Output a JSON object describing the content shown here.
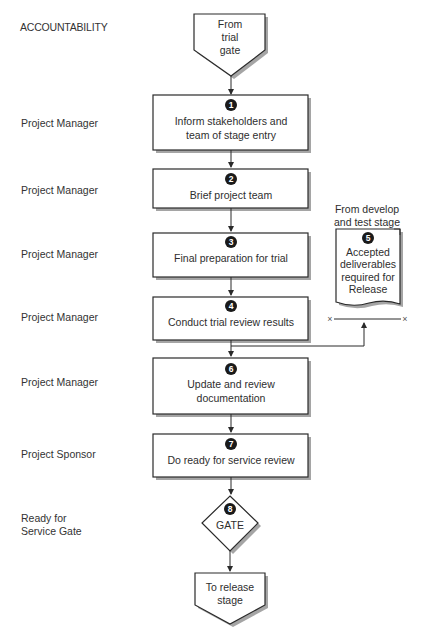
{
  "heading": "ACCOUNTABILITY",
  "colors": {
    "stroke": "#2a2a2a",
    "shadow": "#9a9a9a",
    "fill": "#ffffff",
    "badge": "#1a1a1a"
  },
  "accountability": [
    {
      "label": "Project Manager",
      "step": "1"
    },
    {
      "label": "Project Manager",
      "step": "2"
    },
    {
      "label": "Project Manager",
      "step": "3"
    },
    {
      "label": "Project Manager",
      "step": "4"
    },
    {
      "label": "Project Manager",
      "step": "6"
    },
    {
      "label": "Project Sponsor",
      "step": "7"
    },
    {
      "label_line1": "Ready for",
      "label_line2": "Service Gate",
      "step": "8"
    }
  ],
  "start": {
    "lines": [
      "From",
      "trial",
      "gate"
    ]
  },
  "steps": [
    {
      "number": "1",
      "lines": [
        "Inform stakeholders and",
        "team of stage entry"
      ]
    },
    {
      "number": "2",
      "lines": [
        "Brief project team"
      ]
    },
    {
      "number": "3",
      "lines": [
        "Final preparation for trial"
      ]
    },
    {
      "number": "4",
      "lines": [
        "Conduct trial review results"
      ]
    },
    {
      "number": "6",
      "lines": [
        "Update and review",
        "documentation"
      ]
    },
    {
      "number": "7",
      "lines": [
        "Do ready for service review"
      ]
    }
  ],
  "input_doc": {
    "caption_lines": [
      "From develop",
      "and test stage"
    ],
    "number": "5",
    "lines": [
      "Accepted",
      "deliverables",
      "required for",
      "Release"
    ]
  },
  "gate": {
    "number": "8",
    "label": "GATE"
  },
  "end": {
    "lines": [
      "To release",
      "stage"
    ]
  }
}
